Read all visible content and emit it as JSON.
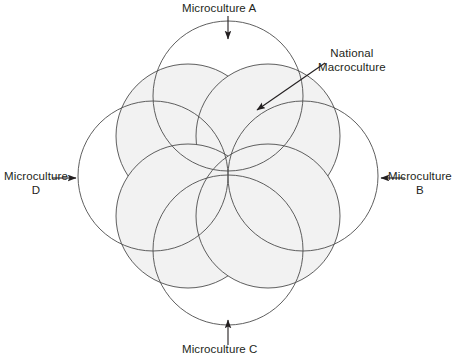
{
  "diagram": {
    "type": "venn-overlap-circles",
    "colors": {
      "stroke": "#4d4d4d",
      "fill_shaded": "#f2f2f2",
      "fill_plain": "#ffffff",
      "text": "#231f20",
      "background": "#ffffff"
    },
    "labels": {
      "microculture_a": "Microculture A",
      "microculture_b": "Microculture\nB",
      "microculture_c": "Microculture C",
      "microculture_d": "Microculture\nD",
      "national_macroculture": "National\nMacroculture"
    },
    "arrows": {
      "microculture_a": "arrow-down",
      "microculture_b": "arrow-left",
      "microculture_c": "arrow-up",
      "microculture_d": "arrow-right",
      "national_macroculture": "arrow-diagonal-down-left"
    },
    "shapes": {
      "macroculture_lobes": [
        {
          "name": "lobe-top-left",
          "cx": 188,
          "cy": 136,
          "r": 72
        },
        {
          "name": "lobe-top-right",
          "cx": 268,
          "cy": 136,
          "r": 72
        },
        {
          "name": "lobe-bottom-left",
          "cx": 188,
          "cy": 216,
          "r": 72
        },
        {
          "name": "lobe-bottom-right",
          "cx": 268,
          "cy": 216,
          "r": 72
        }
      ],
      "microculture_circles": [
        {
          "name": "microculture-a-circle",
          "cx": 228,
          "cy": 96,
          "r": 75
        },
        {
          "name": "microculture-b-circle",
          "cx": 303,
          "cy": 176,
          "r": 75
        },
        {
          "name": "microculture-c-circle",
          "cx": 228,
          "cy": 250,
          "r": 75
        },
        {
          "name": "microculture-d-circle",
          "cx": 153,
          "cy": 176,
          "r": 75
        }
      ]
    }
  }
}
